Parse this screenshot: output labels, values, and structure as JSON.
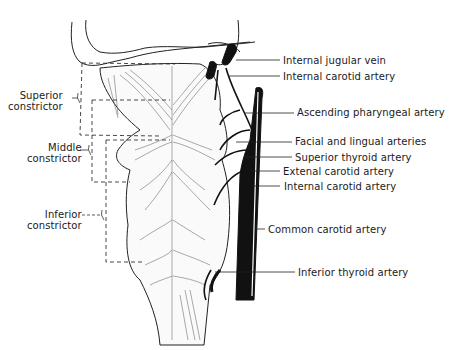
{
  "diagram": {
    "left_labels": [
      {
        "id": "superior",
        "line1": "Superior",
        "line2": "constrictor",
        "x": 8,
        "y": 90
      },
      {
        "id": "middle",
        "line1": "Middle",
        "line2": "constrictor",
        "x": 27,
        "y": 142
      },
      {
        "id": "inferior",
        "line1": "Inferior",
        "line2": "constrictor",
        "x": 27,
        "y": 209
      }
    ],
    "right_labels": [
      {
        "id": "internal-jugular-vein",
        "text": "Internal jugular vein",
        "x": 283,
        "y": 55
      },
      {
        "id": "internal-carotid-artery-upper",
        "text": "Internal carotid artery",
        "x": 283,
        "y": 71
      },
      {
        "id": "ascending-pharyngeal-artery",
        "text": "Ascending pharyngeal artery",
        "x": 297,
        "y": 107
      },
      {
        "id": "facial-lingual-arteries",
        "text": "Facial and lingual arteries",
        "x": 295,
        "y": 136
      },
      {
        "id": "superior-thyroid-artery",
        "text": "Superior thyroid artery",
        "x": 295,
        "y": 152
      },
      {
        "id": "external-carotid-artery",
        "text": "Extenal carotid artery",
        "x": 283,
        "y": 166
      },
      {
        "id": "internal-carotid-artery-lower",
        "text": "Internal carotid artery",
        "x": 284,
        "y": 181
      },
      {
        "id": "common-carotid-artery",
        "text": "Common carotid artery",
        "x": 268,
        "y": 224
      },
      {
        "id": "inferior-thyroid-artery",
        "text": "Inferior thyroid artery",
        "x": 298,
        "y": 267
      }
    ]
  }
}
